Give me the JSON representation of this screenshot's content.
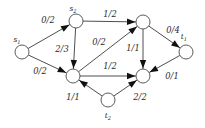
{
  "diagram": {
    "kind": "flow-network",
    "label_format": "flow/capacity",
    "background_color": "#ffffff",
    "stroke_color": "#3a3a3a",
    "arrow_color": "#111111",
    "node_fill": "#ffffff",
    "width": 205,
    "height": 128,
    "nodes": [
      {
        "id": "s1",
        "name": "s",
        "subscript": "1",
        "x": 22,
        "y": 52,
        "r": 7.0,
        "label_x": 17,
        "label_y": 40
      },
      {
        "id": "s2",
        "name": "s",
        "subscript": "2",
        "x": 76,
        "y": 21,
        "r": 7.0,
        "label_x": 73,
        "label_y": 9
      },
      {
        "id": "a",
        "name": "",
        "subscript": "",
        "x": 143,
        "y": 22,
        "r": 7.0,
        "label_x": 143,
        "label_y": 22
      },
      {
        "id": "b",
        "name": "",
        "subscript": "",
        "x": 73,
        "y": 76,
        "r": 7.0,
        "label_x": 73,
        "label_y": 76
      },
      {
        "id": "c",
        "name": "",
        "subscript": "",
        "x": 143,
        "y": 76,
        "r": 7.0,
        "label_x": 143,
        "label_y": 76
      },
      {
        "id": "t1",
        "name": "t",
        "subscript": "1",
        "x": 186,
        "y": 52,
        "r": 7.0,
        "label_x": 184,
        "label_y": 37
      },
      {
        "id": "t2",
        "name": "t",
        "subscript": "2",
        "x": 108,
        "y": 100,
        "r": 7.0,
        "label_x": 108,
        "label_y": 116
      }
    ],
    "edges": [
      {
        "id": "e1",
        "from": "s1",
        "to": "s2",
        "flow": 0,
        "capacity": 2,
        "label": "0/2",
        "label_x": 48,
        "label_y": 20
      },
      {
        "id": "e2",
        "from": "s1",
        "to": "b",
        "flow": 0,
        "capacity": 2,
        "label": "0/2",
        "label_x": 40,
        "label_y": 71
      },
      {
        "id": "e3",
        "from": "s2",
        "to": "a",
        "flow": 1,
        "capacity": 2,
        "label": "1/2",
        "label_x": 110,
        "label_y": 14
      },
      {
        "id": "e4",
        "from": "s2",
        "to": "b",
        "flow": 2,
        "capacity": 3,
        "label": "2/3",
        "label_x": 62,
        "label_y": 49
      },
      {
        "id": "e5",
        "from": "b",
        "to": "a",
        "flow": 0,
        "capacity": 2,
        "label": "0/2",
        "label_x": 99,
        "label_y": 42
      },
      {
        "id": "e6",
        "from": "b",
        "to": "c",
        "flow": 1,
        "capacity": 2,
        "label": "1/2",
        "label_x": 110,
        "label_y": 66
      },
      {
        "id": "e7",
        "from": "a",
        "to": "c",
        "flow": 1,
        "capacity": 1,
        "label": "1/1",
        "label_x": 133,
        "label_y": 48
      },
      {
        "id": "e8",
        "from": "a",
        "to": "t1",
        "flow": 0,
        "capacity": 4,
        "label": "0/4",
        "label_x": 173,
        "label_y": 30
      },
      {
        "id": "e9",
        "from": "t1",
        "to": "c",
        "flow": 0,
        "capacity": 1,
        "label": "0/1",
        "label_x": 172,
        "label_y": 76
      },
      {
        "id": "e10",
        "from": "t2",
        "to": "b",
        "flow": 1,
        "capacity": 1,
        "label": "1/1",
        "label_x": 73,
        "label_y": 97
      },
      {
        "id": "e11",
        "from": "t2",
        "to": "c",
        "flow": 2,
        "capacity": 2,
        "label": "2/2",
        "label_x": 140,
        "label_y": 97
      }
    ]
  }
}
